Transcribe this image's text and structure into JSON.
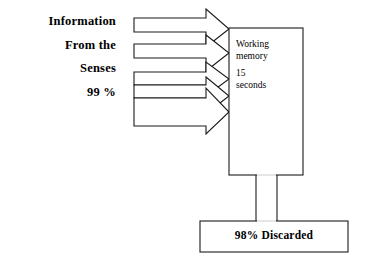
{
  "diagram": {
    "colors": {
      "background": "#ffffff",
      "stroke": "#1a1a1a",
      "text": "#000000",
      "shape_fill": "#ffffff"
    },
    "source_label": {
      "line1": "Information",
      "line2": "From the",
      "line3": "Senses",
      "line4": "99 %"
    },
    "arrows": {
      "icon": "block-arrow-right-icon",
      "count": 5,
      "direction": "right",
      "description": "Five block arrows pointing right into the working memory box"
    },
    "working_memory_box": {
      "line1": "Working",
      "line2": "memory",
      "line3": "15",
      "line4": "seconds"
    },
    "connector": {
      "icon": "vertical-connector-icon",
      "description": "Vertical channel from working memory box down to discarded box"
    },
    "discarded_box": {
      "label": "98% Discarded"
    }
  }
}
